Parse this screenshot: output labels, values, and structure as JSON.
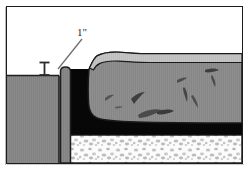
{
  "figure": {
    "frame": {
      "border_color": "#1c1c1c",
      "background": "#ffffff"
    }
  },
  "annotations": {
    "dimension_callout": {
      "label": "1\"",
      "name": "one-inch-dimension-label",
      "leader_line": {
        "from_x": 51,
        "from_y": 62,
        "to_x": 74,
        "to_y": 31,
        "color": "#6f6f6f"
      },
      "marker": {
        "type": "i-beam-dimension-marker",
        "x": 37,
        "top_y": 55,
        "bottom_y": 68,
        "color": "#2b2b2b"
      }
    }
  },
  "layers": {
    "left_slab": {
      "name": "left-concrete-slab",
      "fill": "#8a8a8a",
      "stroke": "#1f1f1f",
      "top_y": 68,
      "left_x": 0,
      "right_x": 52,
      "bottom_y": 156
    },
    "joint_column": {
      "name": "joint-filler-column",
      "fill": "#8a8a8a",
      "stroke": "#1f1f1f",
      "left_x": 52,
      "right_x": 64,
      "top_y": 61,
      "bottom_y": 156
    },
    "void_black": {
      "name": "black-void-subbase",
      "fill": "#070707",
      "left_x": 64,
      "right_x": 235,
      "top_y": 62,
      "bottom_y": 128
    },
    "raised_slab": {
      "name": "raised-concrete-slab",
      "fill": "#8d8d8d",
      "top_face_fill": "#c3c3c3",
      "stroke": "#1a1a1a",
      "left_x": 82,
      "right_x": 235,
      "top_y": 46,
      "bottom_y": 116
    },
    "gravel_base": {
      "name": "gravel-base-course",
      "fill": "#fbfbfb",
      "speckle_fill": "#b0b0b0",
      "stroke": "#151515",
      "left_x": 56,
      "right_x": 235,
      "top_y": 128,
      "bottom_y": 156
    }
  },
  "colors": {
    "slab_gray": "#8a8a8a",
    "slab_light_top": "#c3c3c3",
    "void_black": "#070707",
    "gravel_white": "#fbfbfb",
    "gravel_speckle": "#b0b0b0",
    "outline": "#1a1a1a",
    "leader_gray": "#6f6f6f",
    "page_white": "#ffffff"
  }
}
